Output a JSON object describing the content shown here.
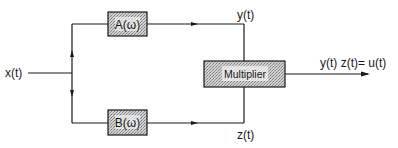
{
  "diagram": {
    "type": "block-diagram",
    "input": {
      "label": "x(t)"
    },
    "blocks": [
      {
        "id": "A",
        "label": "A(ω)"
      },
      {
        "id": "B",
        "label": "B(ω)"
      },
      {
        "id": "mult",
        "label": "Multiplier"
      }
    ],
    "signals": {
      "y": "y(t)",
      "z": "z(t)",
      "output": "y(t) z(t)= u(t)"
    },
    "edges": [
      {
        "from": "x(t)",
        "to": "A"
      },
      {
        "from": "x(t)",
        "to": "B"
      },
      {
        "from": "A",
        "to": "mult",
        "label": "y(t)"
      },
      {
        "from": "B",
        "to": "mult",
        "label": "z(t)"
      },
      {
        "from": "mult",
        "to": "output",
        "label": "y(t) z(t)= u(t)"
      }
    ],
    "colors": {
      "line": "#1a1a1a",
      "block_fill": "#bdbdbd",
      "background": "#ffffff"
    }
  }
}
